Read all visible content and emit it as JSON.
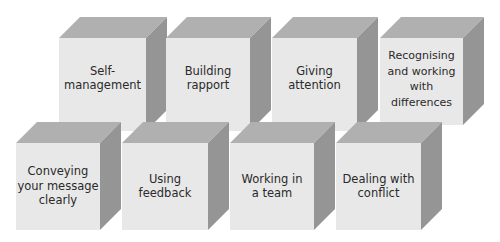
{
  "diagram": {
    "type": "skills-cubes",
    "colors": {
      "front": "#e8e8e8",
      "top": "#b0b0b0",
      "side": "#959595",
      "text": "#2a2a2a",
      "background": "#ffffff"
    },
    "cubes": [
      {
        "label": "Self-\nmanagement",
        "row": 1
      },
      {
        "label": "Building\nrapport",
        "row": 1
      },
      {
        "label": "Giving\nattention",
        "row": 1
      },
      {
        "label": "Recognising\nand working\nwith\ndifferences",
        "row": 1
      },
      {
        "label": "Conveying\nyour message\nclearly",
        "row": 2
      },
      {
        "label": "Using\nfeedback",
        "row": 2
      },
      {
        "label": "Working in\na team",
        "row": 2
      },
      {
        "label": "Dealing with\nconflict",
        "row": 2
      }
    ]
  }
}
